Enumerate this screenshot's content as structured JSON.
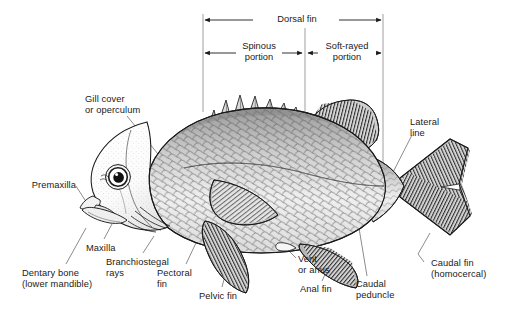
{
  "figure": {
    "style": "black-and-white line illustration",
    "background_color": "#ffffff",
    "ink_color": "#1a1a1a",
    "leader_line_color": "#555555"
  },
  "brackets": [
    {
      "id": "dorsal-fin",
      "label": "Dorsal fin",
      "arrow_ends": "both",
      "x_start": 203,
      "x_end": 383,
      "y": 20
    },
    {
      "id": "spinous-portion",
      "label": "Spinous\nportion",
      "arrow_ends": "both",
      "x_start": 203,
      "x_end": 303,
      "y": 53
    },
    {
      "id": "soft-rayed-portion",
      "label": "Soft-rayed\nportion",
      "arrow_ends": "both",
      "x_start": 307,
      "x_end": 383,
      "y": 53
    }
  ],
  "labels": [
    {
      "id": "gill-cover",
      "text": "Gill cover\nor operculum",
      "align": "left",
      "x": 85,
      "y": 94,
      "anchor_x": 180,
      "anchor_y": 181
    },
    {
      "id": "premaxilla",
      "text": "Premaxilla",
      "align": "right",
      "x": 31,
      "y": 180,
      "anchor_x": 92,
      "anchor_y": 211
    },
    {
      "id": "maxilla",
      "text": "Maxilla",
      "align": "left",
      "x": 86,
      "y": 243,
      "anchor_x": 108,
      "anchor_y": 222
    },
    {
      "id": "dentary-bone",
      "text": "Dentary bone\n(lower mandible)",
      "align": "left",
      "x": 24,
      "y": 268,
      "anchor_x": 85,
      "anchor_y": 226
    },
    {
      "id": "branchiostegal-rays",
      "text": "Branchiostegal\nrays",
      "align": "left",
      "x": 106,
      "y": 257,
      "anchor_x": 152,
      "anchor_y": 234
    },
    {
      "id": "pectoral-fin",
      "text": "Pectoral\nfin",
      "align": "left",
      "x": 157,
      "y": 268,
      "anchor_x": 203,
      "anchor_y": 223
    },
    {
      "id": "pelvic-fin",
      "text": "Pelvic fin",
      "align": "left",
      "x": 199,
      "y": 291,
      "anchor_x": 228,
      "anchor_y": 252
    },
    {
      "id": "vent-or-anus",
      "text": "Vent\nor anus",
      "align": "left",
      "x": 290,
      "y": 255,
      "anchor_x": 283,
      "anchor_y": 247
    },
    {
      "id": "anal-fin",
      "text": "Anal fin",
      "align": "left",
      "x": 300,
      "y": 285,
      "anchor_x": 330,
      "anchor_y": 253
    },
    {
      "id": "caudal-peduncle",
      "text": "Caudal\npeduncle",
      "align": "left",
      "x": 355,
      "y": 280,
      "anchor_x": 351,
      "anchor_y": 188
    },
    {
      "id": "caudal-fin",
      "text": "Caudal fin\n(homocercal)",
      "align": "left",
      "x": 420,
      "y": 259,
      "anchor_x": 428,
      "anchor_y": 231
    },
    {
      "id": "lateral-line",
      "text": "Lateral\nline",
      "align": "left",
      "x": 410,
      "y": 118,
      "anchor_x": 385,
      "anchor_y": 185
    }
  ]
}
